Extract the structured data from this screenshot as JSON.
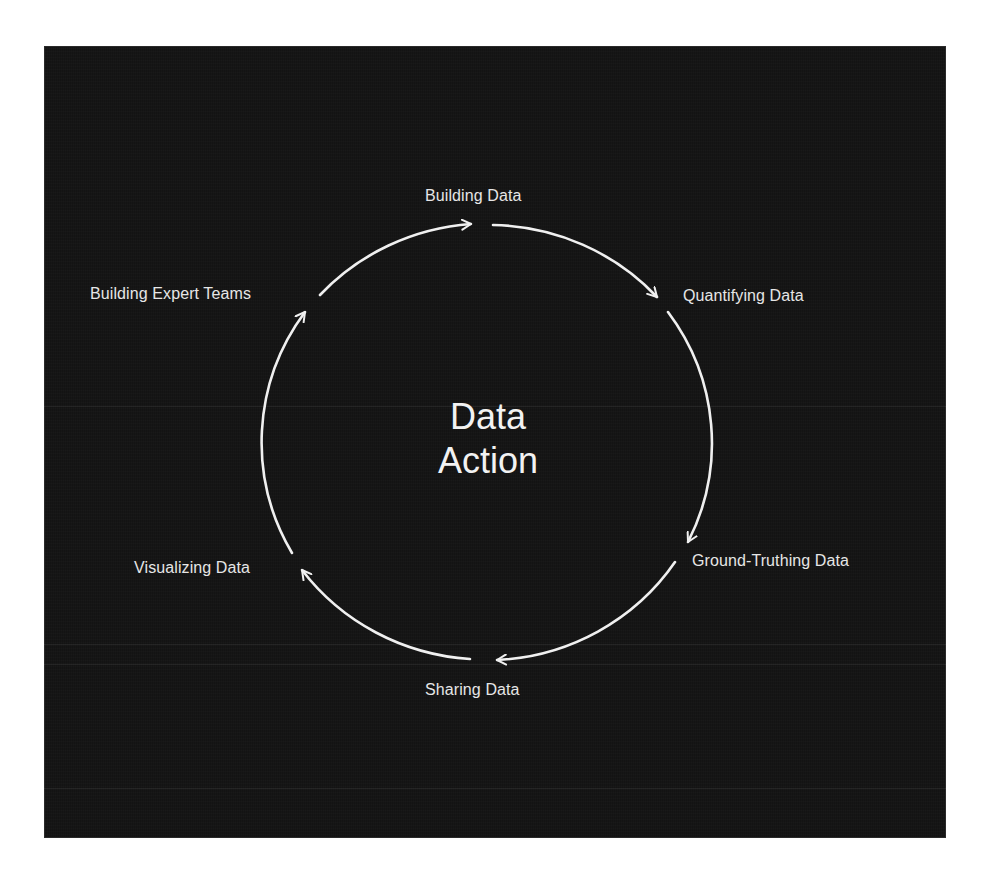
{
  "diagram": {
    "type": "cycle",
    "background_color": "#161616",
    "stroke_color": "#f0f0f0",
    "text_color": "#e6e6e6",
    "center_title": {
      "line1": "Data",
      "line2": "Action"
    },
    "nodes": [
      {
        "id": "building-data",
        "label": "Building Data"
      },
      {
        "id": "quantifying-data",
        "label": "Quantifying Data"
      },
      {
        "id": "ground-truthing-data",
        "label": "Ground-Truthing Data"
      },
      {
        "id": "sharing-data",
        "label": "Sharing Data"
      },
      {
        "id": "visualizing-data",
        "label": "Visualizing Data"
      },
      {
        "id": "building-expert-teams",
        "label": "Building Expert Teams"
      }
    ],
    "edges": [
      {
        "from": "building-expert-teams",
        "to": "building-data",
        "direction": "clockwise"
      },
      {
        "from": "building-data",
        "to": "quantifying-data",
        "direction": "clockwise"
      },
      {
        "from": "quantifying-data",
        "to": "ground-truthing-data",
        "direction": "clockwise"
      },
      {
        "from": "ground-truthing-data",
        "to": "sharing-data",
        "direction": "clockwise"
      },
      {
        "from": "sharing-data",
        "to": "visualizing-data",
        "direction": "clockwise"
      },
      {
        "from": "visualizing-data",
        "to": "building-expert-teams",
        "direction": "clockwise"
      }
    ]
  }
}
